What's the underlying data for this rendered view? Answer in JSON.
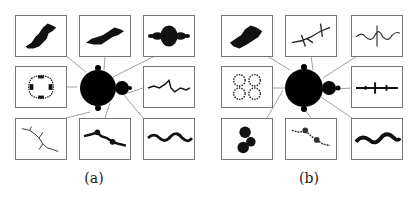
{
  "figure": {
    "panels": [
      {
        "caption": "(a)",
        "center": "mandelbrot-set",
        "julia_thumbnails": [
          {
            "position": "top-left",
            "shape": "dendrite-blob"
          },
          {
            "position": "top-center",
            "shape": "twin-blob"
          },
          {
            "position": "top-right",
            "shape": "basilica"
          },
          {
            "position": "middle-left",
            "shape": "rabbit-ring"
          },
          {
            "position": "middle-right",
            "shape": "wiggly-line"
          },
          {
            "position": "bottom-left",
            "shape": "branched-dendrite"
          },
          {
            "position": "bottom-center",
            "shape": "dusty-spirals"
          },
          {
            "position": "bottom-right",
            "shape": "wavy-chain"
          }
        ]
      },
      {
        "caption": "(b)",
        "center": "mandelbrot-set",
        "julia_thumbnails": [
          {
            "position": "top-left",
            "shape": "dense-blob"
          },
          {
            "position": "top-center",
            "shape": "star-dendrite"
          },
          {
            "position": "top-right",
            "shape": "thin-wiggly-line"
          },
          {
            "position": "middle-left",
            "shape": "spiral-dust"
          },
          {
            "position": "middle-right",
            "shape": "spiky-line"
          },
          {
            "position": "bottom-left",
            "shape": "clustered-blob"
          },
          {
            "position": "bottom-center",
            "shape": "sparse-spirals"
          },
          {
            "position": "bottom-right",
            "shape": "wavy-band"
          }
        ]
      }
    ]
  }
}
